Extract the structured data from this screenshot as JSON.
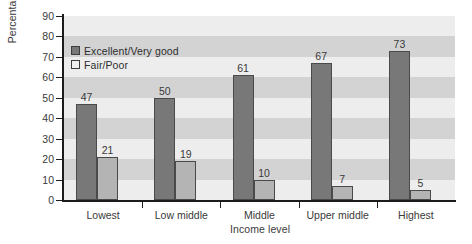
{
  "chart_data": {
    "type": "bar",
    "title": "",
    "xlabel": "Income level",
    "ylabel": "Percentage",
    "categories": [
      "Lowest",
      "Low middle",
      "Middle",
      "Upper middle",
      "Highest"
    ],
    "series": [
      {
        "name": "Excellent/Very good",
        "color": "#787878",
        "values": [
          47,
          50,
          61,
          67,
          73
        ]
      },
      {
        "name": "Fair/Poor",
        "color": "#b4b4b4",
        "values": [
          21,
          19,
          10,
          7,
          5
        ]
      }
    ],
    "ylim": [
      0,
      90
    ],
    "yticks": [
      0,
      10,
      20,
      30,
      40,
      50,
      60,
      70,
      80,
      90
    ],
    "ytick_labels": [
      "0",
      "10",
      "20",
      "30",
      "40",
      "50",
      "60",
      "70",
      "80",
      "90"
    ],
    "grid": false,
    "background_bands": true,
    "legend_position": "upper left",
    "data_labels": true
  },
  "axes": {
    "y_title": "Percentage",
    "x_title": "Income level"
  },
  "legend": {
    "items": [
      {
        "label": "Excellent/Very good",
        "swatch": "dark-gray"
      },
      {
        "label": "Fair/Poor",
        "swatch": "light-gray"
      }
    ]
  },
  "colors": {
    "series_excellent": "#787878",
    "series_fair": "#b4b4b4",
    "plot_band_light": "#ededed",
    "plot_band_dark": "#d3d3d3",
    "axis": "#1c1c1c",
    "text": "#3a3a3a"
  }
}
